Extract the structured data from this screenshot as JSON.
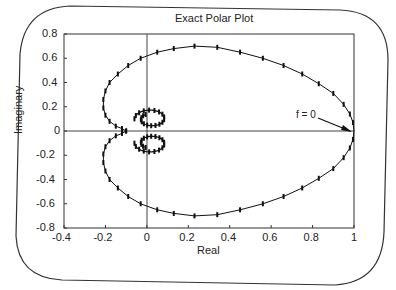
{
  "chart_data": {
    "type": "line",
    "title": "Exact Polar Plot",
    "xlabel": "Real",
    "ylabel": "Imaginary",
    "xlim": [
      -0.4,
      1.0
    ],
    "ylim": [
      -0.8,
      0.8
    ],
    "xticks": [
      "-0.4",
      "-0.2",
      "0",
      "0.2",
      "0.4",
      "0.6",
      "0.8",
      "1"
    ],
    "yticks": [
      "0.8",
      "0.6",
      "0.4",
      "0.2",
      "0",
      "-0.2",
      "-0.4",
      "-0.6",
      "-0.8"
    ],
    "grid": false,
    "annotations": [
      {
        "text": "f = 0",
        "x": 1.0,
        "y": 0.0
      }
    ],
    "series": [
      {
        "name": "polar plot (upper half)",
        "x": [
          1.0,
          0.995,
          0.98,
          0.95,
          0.9,
          0.83,
          0.75,
          0.66,
          0.56,
          0.45,
          0.34,
          0.23,
          0.13,
          0.05,
          -0.03,
          -0.09,
          -0.14,
          -0.18,
          -0.2,
          -0.21,
          -0.21,
          -0.2,
          -0.18,
          -0.15,
          -0.12,
          -0.1
        ],
        "y": [
          0.0,
          0.07,
          0.14,
          0.22,
          0.31,
          0.39,
          0.47,
          0.54,
          0.6,
          0.65,
          0.69,
          0.7,
          0.68,
          0.65,
          0.6,
          0.54,
          0.47,
          0.4,
          0.33,
          0.26,
          0.19,
          0.13,
          0.08,
          0.04,
          0.02,
          0.0
        ]
      },
      {
        "name": "polar plot (lower half)",
        "x": [
          1.0,
          0.995,
          0.98,
          0.95,
          0.9,
          0.83,
          0.75,
          0.66,
          0.56,
          0.45,
          0.34,
          0.23,
          0.13,
          0.05,
          -0.03,
          -0.09,
          -0.14,
          -0.18,
          -0.2,
          -0.21,
          -0.21,
          -0.2,
          -0.18,
          -0.15,
          -0.12,
          -0.1
        ],
        "y": [
          0.0,
          -0.07,
          -0.14,
          -0.22,
          -0.31,
          -0.39,
          -0.47,
          -0.54,
          -0.6,
          -0.65,
          -0.69,
          -0.7,
          -0.68,
          -0.65,
          -0.6,
          -0.54,
          -0.47,
          -0.4,
          -0.33,
          -0.26,
          -0.19,
          -0.13,
          -0.08,
          -0.04,
          -0.02,
          0.0
        ]
      }
    ]
  },
  "labels": {
    "title": "Exact Polar Plot",
    "xlabel": "Real",
    "ylabel": "Imaginary",
    "annotation": "f = 0"
  }
}
